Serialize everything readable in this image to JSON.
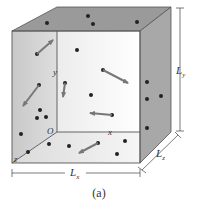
{
  "figure": {
    "caption": "(a)",
    "labels": {
      "origin": "O",
      "x_axis": "x",
      "y_axis": "y",
      "z_axis": "z",
      "length_x": "L",
      "length_x_sub": "x",
      "length_y": "L",
      "length_y_sub": "y",
      "length_z": "L",
      "length_z_sub": "z"
    },
    "colors": {
      "top_face": "#9a9a9a",
      "right_face": "#a8a8a8",
      "back_face": "#f4f4f4",
      "left_face": "#d2d2d2",
      "bottom_face": "#e6e6e6",
      "edge": "#555555",
      "molecule": "#222222",
      "velocity_arrow": "#777777"
    }
  }
}
